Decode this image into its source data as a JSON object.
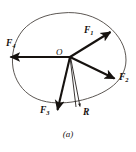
{
  "figure": {
    "caption": "(a)",
    "background_color": "#ffffff",
    "ink_color": "#16120f",
    "outline_color": "#4a4440",
    "origin_label": "O",
    "body_outline_name": "rigid-body-outline",
    "vectors": [
      {
        "id": "F1",
        "base": "F",
        "sub": "1",
        "label_text": "F1",
        "direction": "up-right",
        "style": "thick-solid",
        "from": [
          70,
          57
        ],
        "to": [
          112,
          31
        ]
      },
      {
        "id": "F2",
        "base": "F",
        "sub": "2",
        "label_text": "F2",
        "direction": "down-right",
        "style": "thick-solid",
        "from": [
          70,
          57
        ],
        "to": [
          116,
          79
        ]
      },
      {
        "id": "F3",
        "base": "F",
        "sub": "3",
        "label_text": "F3",
        "direction": "down-left",
        "style": "thick-solid",
        "from": [
          70,
          57
        ],
        "to": [
          57,
          112
        ]
      },
      {
        "id": "F4",
        "base": "F",
        "sub": "4",
        "label_text": "F4",
        "direction": "left",
        "style": "thick-solid",
        "from": [
          70,
          57
        ],
        "to": [
          9,
          57
        ]
      },
      {
        "id": "R",
        "base": "R",
        "sub": "",
        "label_text": "R",
        "direction": "down-slightly-right",
        "style": "thin-double-line",
        "from": [
          70,
          57
        ],
        "to": [
          80,
          110
        ]
      }
    ]
  }
}
